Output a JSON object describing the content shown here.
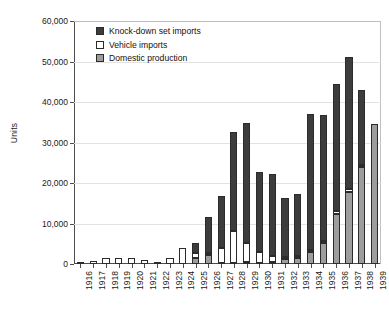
{
  "chart_data": {
    "type": "bar",
    "subtype": "stacked-vertical-bar",
    "title": "",
    "xlabel": "",
    "ylabel": "Units",
    "ylim": [
      0,
      60000
    ],
    "ytick_labels": [
      "0",
      "10,000",
      "20,000",
      "30,000",
      "40,000",
      "50,000",
      "60,000"
    ],
    "ytick_values": [
      0,
      10000,
      20000,
      30000,
      40000,
      50000,
      60000
    ],
    "grid": true,
    "grid_axis": "y",
    "legend_position": "top-left-inside",
    "categories": [
      "1916",
      "1917",
      "1918",
      "1919",
      "1920",
      "1921",
      "1922",
      "1923",
      "1924",
      "1925",
      "1926",
      "1927",
      "1928",
      "1929",
      "1930",
      "1931",
      "1932",
      "1933",
      "1934",
      "1935",
      "1936",
      "1937",
      "1938",
      "1939"
    ],
    "series": [
      {
        "name": "Domestic production",
        "color": "#9d9d9d",
        "values": [
          0,
          0,
          0,
          0,
          0,
          0,
          0,
          0,
          0,
          1400,
          2300,
          300,
          300,
          500,
          300,
          400,
          1300,
          1500,
          2900,
          5100,
          12400,
          17800,
          24000,
          34500
        ]
      },
      {
        "name": "Vehicle imports",
        "color": "#ffffff",
        "values": [
          400,
          800,
          1400,
          1400,
          1400,
          900,
          500,
          1600,
          3900,
          1300,
          400,
          3700,
          7800,
          4700,
          2600,
          1700,
          400,
          400,
          500,
          600,
          700,
          700,
          400,
          0
        ]
      },
      {
        "name": "Knock-down set imports",
        "color": "#3c3c3c",
        "values": [
          0,
          0,
          0,
          0,
          0,
          0,
          0,
          0,
          0,
          2500,
          8800,
          12900,
          24600,
          29700,
          19900,
          20200,
          14600,
          15400,
          33700,
          31100,
          31300,
          32500,
          18500,
          0
        ]
      }
    ],
    "totals": [
      400,
      800,
      1400,
      1400,
      1400,
      900,
      500,
      1600,
      3900,
      5200,
      11500,
      16900,
      32700,
      34900,
      22800,
      22300,
      16300,
      17300,
      37100,
      36800,
      44400,
      51000,
      42900,
      34500
    ]
  },
  "legend": {
    "items": [
      {
        "label": "Knock-down set imports",
        "swatch": "dark-square-swatch"
      },
      {
        "label": "Vehicle imports",
        "swatch": "white-square-swatch"
      },
      {
        "label": "Domestic production",
        "swatch": "gray-square-swatch"
      }
    ]
  },
  "axes": {
    "y_title": "Units"
  }
}
